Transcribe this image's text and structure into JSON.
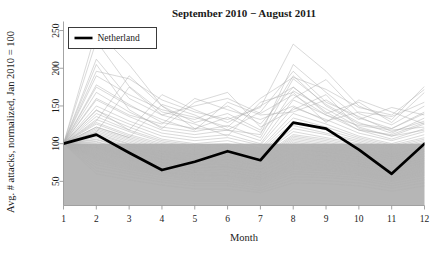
{
  "chart_data": {
    "type": "line",
    "title": "September 2010 − August 2011",
    "xlabel": "Month",
    "ylabel": "Avg. # attacks, normalized, Jan 2010 = 100",
    "x": [
      1,
      2,
      3,
      4,
      5,
      6,
      7,
      8,
      9,
      10,
      11,
      12
    ],
    "xticklabels": [
      "1",
      "2",
      "3",
      "4",
      "5",
      "6",
      "7",
      "8",
      "9",
      "10",
      "11",
      "12"
    ],
    "yticklabels": [
      "50",
      "100",
      "150",
      "200",
      "250"
    ],
    "yticks": [
      50,
      100,
      150,
      200,
      250
    ],
    "xlim": [
      1,
      12
    ],
    "ylim": [
      18,
      262
    ],
    "grid": false,
    "legend": {
      "position": "top-left",
      "entries": [
        {
          "label": "Netherland",
          "color": "#000000",
          "width": 2.6
        }
      ]
    },
    "shaded_band": {
      "from": 18,
      "to": 100,
      "color": "#b6b6b6",
      "note": "gray region below normalized value 100"
    },
    "highlight_color": "#000000",
    "background_series_color": "#b0b0b0",
    "axis_color": "#9a9a9a",
    "series": [
      {
        "name": "Netherland",
        "highlight": true,
        "values": [
          100,
          112,
          88,
          65,
          76,
          90,
          78,
          128,
          120,
          92,
          60,
          100
        ]
      },
      {
        "name": "bg01",
        "values": [
          100,
          250,
          205,
          150,
          128,
          140,
          118,
          190,
          150,
          126,
          120,
          140
        ]
      },
      {
        "name": "bg02",
        "values": [
          100,
          236,
          176,
          142,
          132,
          150,
          126,
          175,
          142,
          118,
          112,
          128
        ]
      },
      {
        "name": "bg03",
        "values": [
          100,
          212,
          160,
          138,
          150,
          160,
          140,
          165,
          138,
          124,
          118,
          122
        ]
      },
      {
        "name": "bg04",
        "values": [
          100,
          196,
          186,
          158,
          142,
          132,
          148,
          232,
          196,
          150,
          132,
          176
        ]
      },
      {
        "name": "bg05",
        "values": [
          100,
          178,
          152,
          128,
          120,
          118,
          112,
          205,
          168,
          134,
          120,
          142
        ]
      },
      {
        "name": "bg06",
        "values": [
          100,
          168,
          142,
          122,
          116,
          124,
          108,
          186,
          152,
          128,
          114,
          134
        ]
      },
      {
        "name": "bg07",
        "values": [
          100,
          158,
          136,
          118,
          112,
          118,
          104,
          170,
          146,
          122,
          110,
          126
        ]
      },
      {
        "name": "bg08",
        "values": [
          100,
          150,
          130,
          114,
          108,
          112,
          100,
          158,
          138,
          118,
          106,
          120
        ]
      },
      {
        "name": "bg09",
        "values": [
          100,
          144,
          126,
          110,
          104,
          108,
          98,
          148,
          132,
          114,
          104,
          116
        ]
      },
      {
        "name": "bg10",
        "values": [
          100,
          140,
          122,
          106,
          100,
          104,
          94,
          140,
          126,
          110,
          100,
          112
        ]
      },
      {
        "name": "bg11",
        "values": [
          100,
          136,
          118,
          104,
          98,
          100,
          92,
          134,
          122,
          108,
          98,
          108
        ]
      },
      {
        "name": "bg12",
        "values": [
          100,
          132,
          116,
          102,
          96,
          98,
          90,
          128,
          118,
          106,
          96,
          106
        ]
      },
      {
        "name": "bg13",
        "values": [
          100,
          128,
          112,
          100,
          94,
          96,
          88,
          124,
          114,
          104,
          94,
          104
        ]
      },
      {
        "name": "bg14",
        "values": [
          100,
          126,
          110,
          98,
          92,
          94,
          86,
          120,
          112,
          102,
          92,
          102
        ]
      },
      {
        "name": "bg15",
        "values": [
          100,
          122,
          108,
          96,
          90,
          92,
          84,
          116,
          108,
          100,
          90,
          100
        ]
      },
      {
        "name": "bg16",
        "values": [
          100,
          120,
          106,
          94,
          88,
          90,
          82,
          112,
          106,
          98,
          88,
          98
        ]
      },
      {
        "name": "bg17",
        "values": [
          100,
          118,
          104,
          92,
          86,
          88,
          80,
          110,
          104,
          96,
          86,
          96
        ]
      },
      {
        "name": "bg18",
        "values": [
          100,
          116,
          102,
          90,
          85,
          86,
          79,
          108,
          102,
          94,
          85,
          95
        ]
      },
      {
        "name": "bg19",
        "values": [
          100,
          114,
          100,
          89,
          83,
          85,
          77,
          106,
          100,
          92,
          83,
          93
        ]
      },
      {
        "name": "bg20",
        "values": [
          100,
          112,
          99,
          87,
          82,
          83,
          76,
          104,
          98,
          91,
          82,
          92
        ]
      },
      {
        "name": "bg21",
        "values": [
          100,
          110,
          97,
          86,
          80,
          82,
          74,
          102,
          96,
          89,
          80,
          90
        ]
      },
      {
        "name": "bg22",
        "values": [
          100,
          108,
          96,
          84,
          79,
          80,
          73,
          100,
          94,
          88,
          79,
          89
        ]
      },
      {
        "name": "bg23",
        "values": [
          100,
          106,
          94,
          83,
          77,
          79,
          71,
          98,
          93,
          86,
          77,
          87
        ]
      },
      {
        "name": "bg24",
        "values": [
          100,
          105,
          93,
          82,
          76,
          78,
          70,
          96,
          91,
          85,
          76,
          86
        ]
      },
      {
        "name": "bg25",
        "values": [
          100,
          103,
          91,
          80,
          75,
          76,
          69,
          94,
          89,
          83,
          74,
          84
        ]
      },
      {
        "name": "bg26",
        "values": [
          100,
          102,
          90,
          79,
          73,
          75,
          67,
          92,
          88,
          82,
          73,
          83
        ]
      },
      {
        "name": "bg27",
        "values": [
          100,
          100,
          88,
          78,
          72,
          73,
          66,
          90,
          86,
          80,
          71,
          81
        ]
      },
      {
        "name": "bg28",
        "values": [
          100,
          98,
          87,
          76,
          71,
          72,
          65,
          88,
          84,
          79,
          70,
          80
        ]
      },
      {
        "name": "bg29",
        "values": [
          100,
          97,
          85,
          75,
          69,
          70,
          63,
          86,
          83,
          77,
          68,
          78
        ]
      },
      {
        "name": "bg30",
        "values": [
          100,
          95,
          84,
          74,
          68,
          69,
          62,
          84,
          81,
          76,
          67,
          77
        ]
      },
      {
        "name": "bg31",
        "values": [
          100,
          94,
          82,
          72,
          67,
          68,
          61,
          82,
          79,
          74,
          65,
          75
        ]
      },
      {
        "name": "bg32",
        "values": [
          100,
          92,
          81,
          71,
          65,
          66,
          59,
          80,
          78,
          73,
          64,
          74
        ]
      },
      {
        "name": "bg33",
        "values": [
          100,
          90,
          79,
          70,
          64,
          65,
          58,
          78,
          76,
          71,
          62,
          72
        ]
      },
      {
        "name": "bg34",
        "values": [
          100,
          88,
          78,
          68,
          62,
          63,
          56,
          76,
          74,
          70,
          61,
          70
        ]
      },
      {
        "name": "bg35",
        "values": [
          100,
          86,
          76,
          67,
          61,
          62,
          55,
          74,
          72,
          68,
          59,
          68
        ]
      },
      {
        "name": "bg36",
        "values": [
          100,
          84,
          74,
          65,
          59,
          60,
          53,
          72,
          70,
          66,
          57,
          66
        ]
      },
      {
        "name": "bg37",
        "values": [
          100,
          82,
          72,
          63,
          58,
          58,
          52,
          70,
          68,
          64,
          55,
          64
        ]
      },
      {
        "name": "bg38",
        "values": [
          100,
          80,
          70,
          62,
          56,
          57,
          50,
          68,
          66,
          62,
          54,
          62
        ]
      },
      {
        "name": "bg39",
        "values": [
          100,
          78,
          68,
          60,
          54,
          55,
          48,
          66,
          64,
          60,
          52,
          60
        ]
      },
      {
        "name": "bg40",
        "values": [
          100,
          75,
          66,
          58,
          52,
          53,
          46,
          63,
          61,
          58,
          50,
          58
        ]
      },
      {
        "name": "bg41",
        "values": [
          100,
          72,
          63,
          55,
          50,
          50,
          44,
          60,
          58,
          55,
          47,
          55
        ]
      },
      {
        "name": "bg42",
        "values": [
          100,
          68,
          60,
          52,
          47,
          47,
          41,
          56,
          55,
          52,
          44,
          52
        ]
      },
      {
        "name": "bg43",
        "values": [
          100,
          64,
          56,
          49,
          44,
          44,
          38,
          52,
          51,
          48,
          41,
          48
        ]
      },
      {
        "name": "bg44",
        "values": [
          100,
          60,
          52,
          45,
          40,
          40,
          35,
          48,
          47,
          44,
          37,
          44
        ]
      },
      {
        "name": "bg45",
        "values": [
          100,
          130,
          190,
          150,
          120,
          135,
          115,
          160,
          185,
          140,
          125,
          150
        ]
      },
      {
        "name": "bg46",
        "values": [
          100,
          145,
          118,
          165,
          145,
          128,
          150,
          175,
          140,
          155,
          128,
          168
        ]
      },
      {
        "name": "bg47",
        "values": [
          100,
          160,
          138,
          126,
          160,
          145,
          132,
          150,
          130,
          142,
          136,
          155
        ]
      },
      {
        "name": "bg48",
        "values": [
          100,
          175,
          150,
          132,
          118,
          155,
          138,
          142,
          158,
          132,
          148,
          138
        ]
      },
      {
        "name": "bg49",
        "values": [
          100,
          190,
          165,
          145,
          135,
          122,
          160,
          188,
          172,
          148,
          138,
          172
        ]
      },
      {
        "name": "bg50",
        "values": [
          100,
          122,
          108,
          152,
          138,
          118,
          142,
          196,
          155,
          136,
          116,
          130
        ]
      },
      {
        "name": "bg51",
        "values": [
          100,
          205,
          145,
          120,
          155,
          168,
          122,
          145,
          165,
          120,
          110,
          118
        ]
      },
      {
        "name": "bg52",
        "values": [
          100,
          115,
          175,
          138,
          126,
          110,
          155,
          168,
          128,
          158,
          142,
          126
        ]
      }
    ]
  }
}
